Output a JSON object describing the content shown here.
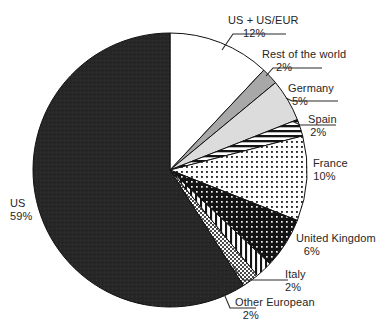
{
  "chart_data": {
    "type": "pie",
    "title": "",
    "subtitle": "",
    "xlabel": "",
    "ylabel": "",
    "legend_position": "none",
    "grid": false,
    "value_suffix": "%",
    "start_angle_deg": 0,
    "direction": "clockwise",
    "categories": [
      "US + US/EUR",
      "Rest of the world",
      "Germany",
      "Spain",
      "France",
      "United Kingdom",
      "Italy",
      "Other European",
      "US"
    ],
    "values": [
      12,
      2,
      5,
      2,
      10,
      6,
      2,
      2,
      59
    ],
    "slices": [
      {
        "label": "US + US/EUR",
        "value": 12,
        "value_text": "12%",
        "fill": "white",
        "color": "#ffffff",
        "label_id": "label-us-useur"
      },
      {
        "label": "Rest of the world",
        "value": 2,
        "value_text": "2%",
        "fill": "gray-medium",
        "color": "#a8a8a8",
        "label_id": "label-rest-world"
      },
      {
        "label": "Germany",
        "value": 5,
        "value_text": "5%",
        "fill": "gray-light",
        "color": "#dcdcdc",
        "label_id": "label-germany"
      },
      {
        "label": "Spain",
        "value": 2,
        "value_text": "2%",
        "fill": "horizontal-lines",
        "color": "#1c1c1c",
        "label_id": "label-spain"
      },
      {
        "label": "France",
        "value": 10,
        "value_text": "10%",
        "fill": "dots-dark-on-white",
        "color": "#333333",
        "label_id": "label-france"
      },
      {
        "label": "United Kingdom",
        "value": 6,
        "value_text": "6%",
        "fill": "dots-white-on-dark",
        "color": "#1c1c1c",
        "label_id": "label-uk"
      },
      {
        "label": "Italy",
        "value": 2,
        "value_text": "2%",
        "fill": "vertical-lines",
        "color": "#1c1c1c",
        "label_id": "label-italy"
      },
      {
        "label": "Other European",
        "value": 2,
        "value_text": "2%",
        "fill": "checker-gray",
        "color": "#808080",
        "label_id": "label-other-euro"
      },
      {
        "label": "US",
        "value": 59,
        "value_text": "59%",
        "fill": "solid-dark",
        "color": "#272727",
        "label_id": "label-us"
      }
    ]
  },
  "labels": {
    "us_useur": {
      "name": "US + US/EUR",
      "pct": "12%"
    },
    "rest_world": {
      "name": "Rest of the world",
      "pct": "2%"
    },
    "germany": {
      "name": "Germany",
      "pct": "5%"
    },
    "spain": {
      "name": "Spain",
      "pct": "2%"
    },
    "france": {
      "name": "France",
      "pct": "10%"
    },
    "uk": {
      "name": "United Kingdom",
      "pct": "6%"
    },
    "italy": {
      "name": "Italy",
      "pct": "2%"
    },
    "other_euro": {
      "name": "Other European",
      "pct": "2%"
    },
    "us": {
      "name": "US",
      "pct": "59%"
    }
  },
  "geometry": {
    "center_x": 170,
    "center_y": 170,
    "radius": 137
  },
  "colors": {
    "background": "#ffffff",
    "outline": "#111111",
    "text": "#262626",
    "leader_line": "#2b2b2b"
  }
}
